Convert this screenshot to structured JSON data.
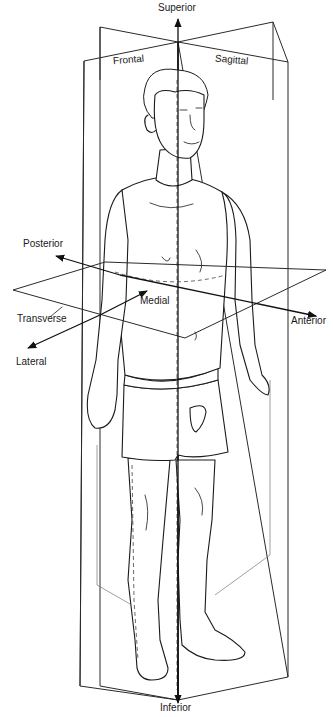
{
  "figure": {
    "colors": {
      "line": "#1a1a1a",
      "background": "#ffffff"
    }
  },
  "planes": [
    {
      "id": "frontal",
      "label": "Frontal"
    },
    {
      "id": "sagittal",
      "label": "Sagittal"
    },
    {
      "id": "transverse",
      "label": "Transverse"
    }
  ],
  "directions": [
    {
      "id": "superior",
      "label": "Superior"
    },
    {
      "id": "inferior",
      "label": "Inferior"
    },
    {
      "id": "posterior",
      "label": "Posterior"
    },
    {
      "id": "anterior",
      "label": "Anterior"
    },
    {
      "id": "medial",
      "label": "Medial"
    },
    {
      "id": "lateral",
      "label": "Lateral"
    }
  ]
}
